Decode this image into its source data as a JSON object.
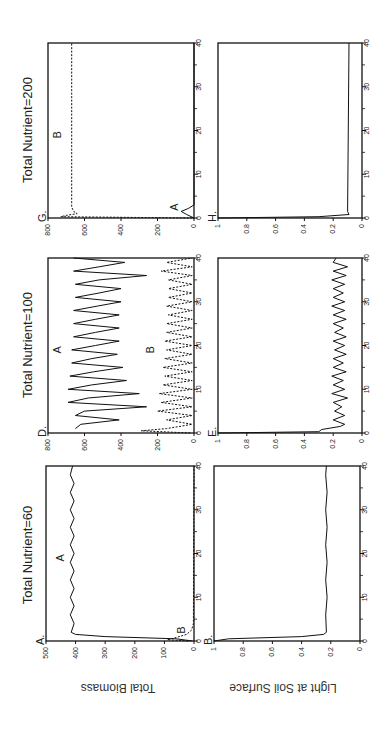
{
  "figure": {
    "orientation": "rotated 90deg counter-clockwise",
    "y_axis_labels": [
      "Total Biomass",
      "Light at Soil Surface"
    ]
  },
  "chart_data": [
    {
      "type": "line",
      "panel": "A",
      "column_title": "Total Nutrient=60",
      "ylabel": "Total Biomass",
      "xlabel": "",
      "x_ticks": [
        0,
        10,
        20,
        30,
        40
      ],
      "y_ticks": [
        0,
        100,
        200,
        300,
        400,
        500
      ],
      "xlim": [
        0,
        40
      ],
      "ylim": [
        0,
        500
      ],
      "series": [
        {
          "name": "A",
          "style": "solid",
          "description": "rises quickly to ~410, small oscillations 400-420 with period ~2",
          "x": [
            0,
            0.5,
            1,
            1.5,
            2,
            4,
            6,
            8,
            10,
            12,
            14,
            16,
            18,
            20,
            22,
            24,
            26,
            28,
            30,
            32,
            34,
            36,
            38,
            40
          ],
          "y": [
            5,
            60,
            300,
            400,
            415,
            405,
            418,
            405,
            418,
            405,
            418,
            405,
            418,
            405,
            418,
            405,
            418,
            405,
            418,
            405,
            418,
            405,
            418,
            410
          ]
        },
        {
          "name": "B",
          "style": "dashed",
          "description": "small transient peak ~90 near t=0.3 then decays to ~0",
          "x": [
            0,
            0.3,
            0.8,
            1.5,
            2.5,
            4,
            40
          ],
          "y": [
            20,
            90,
            60,
            25,
            8,
            2,
            0
          ]
        }
      ]
    },
    {
      "type": "line",
      "panel": "B",
      "column_title": "Total Nutrient=60",
      "ylabel": "Light at Soil Surface",
      "xlabel": "",
      "x_ticks": [
        0,
        10,
        20,
        30,
        40
      ],
      "y_ticks": [
        0,
        0.2,
        0.4,
        0.6,
        0.8,
        1
      ],
      "xlim": [
        0,
        40
      ],
      "ylim": [
        0,
        1
      ],
      "series": [
        {
          "name": "light",
          "style": "solid",
          "description": "drops from 1 to ~0.23 by t=1.5, small oscillations ~0.22-0.24",
          "x": [
            0,
            0.5,
            1,
            1.5,
            2,
            6,
            10,
            14,
            18,
            22,
            26,
            30,
            34,
            38,
            40
          ],
          "y": [
            1,
            0.9,
            0.4,
            0.25,
            0.23,
            0.235,
            0.225,
            0.235,
            0.225,
            0.235,
            0.225,
            0.235,
            0.225,
            0.235,
            0.23
          ]
        }
      ]
    },
    {
      "type": "line",
      "panel": "D",
      "column_title": "Total Nutrient=100",
      "ylabel": "Total Biomass",
      "xlabel": "",
      "x_ticks": [
        0,
        10,
        20,
        30,
        40
      ],
      "y_ticks": [
        0,
        200,
        400,
        600,
        800
      ],
      "xlim": [
        0,
        40
      ],
      "ylim": [
        0,
        800
      ],
      "series": [
        {
          "name": "A",
          "style": "solid",
          "description": "large oscillations between ~250-420 troughs and ~650-700 peaks, period ~3",
          "x": [
            1,
            2,
            3,
            4,
            5,
            6,
            7,
            8,
            9,
            10,
            11,
            12,
            13,
            14,
            15,
            16,
            17,
            18,
            19,
            20,
            21,
            22,
            23,
            24,
            25,
            26,
            27,
            28,
            29,
            30,
            31,
            32,
            33,
            34,
            35,
            36,
            37,
            38,
            39,
            40
          ],
          "y": [
            650,
            620,
            410,
            650,
            600,
            260,
            690,
            580,
            300,
            690,
            560,
            370,
            680,
            550,
            390,
            670,
            560,
            420,
            670,
            540,
            410,
            660,
            540,
            410,
            660,
            540,
            410,
            660,
            530,
            400,
            650,
            520,
            400,
            650,
            520,
            260,
            660,
            520,
            380,
            660
          ]
        },
        {
          "name": "B",
          "style": "dashed",
          "description": "oscillations 0 to ~200 out of phase with A",
          "x": [
            0,
            0.5,
            1,
            2,
            3,
            4,
            5,
            6,
            7,
            8,
            9,
            10,
            11,
            12,
            13,
            14,
            15,
            16,
            17,
            18,
            19,
            20,
            21,
            22,
            23,
            24,
            25,
            26,
            27,
            28,
            29,
            30,
            31,
            32,
            33,
            34,
            35,
            36,
            37,
            38,
            39,
            40
          ],
          "y": [
            20,
            290,
            150,
            10,
            150,
            10,
            200,
            10,
            180,
            10,
            190,
            10,
            170,
            10,
            160,
            10,
            170,
            10,
            160,
            10,
            150,
            10,
            160,
            10,
            150,
            10,
            150,
            10,
            140,
            10,
            150,
            10,
            140,
            10,
            140,
            10,
            140,
            10,
            180,
            10,
            150,
            10
          ]
        }
      ]
    },
    {
      "type": "line",
      "panel": "E",
      "column_title": "Total Nutrient=100",
      "ylabel": "Light at Soil Surface",
      "xlabel": "",
      "x_ticks": [
        0,
        10,
        20,
        30,
        40
      ],
      "y_ticks": [
        0,
        0.2,
        0.4,
        0.6,
        0.8,
        1
      ],
      "xlim": [
        0,
        40
      ],
      "ylim": [
        0,
        1
      ],
      "series": [
        {
          "name": "light",
          "style": "solid",
          "description": "drops from 1 to ~0.25, then oscillates 0.1-0.22",
          "x": [
            0,
            0.3,
            0.8,
            1.5,
            2,
            3,
            4,
            5,
            6,
            7,
            8,
            9,
            10,
            11,
            12,
            13,
            14,
            15,
            16,
            17,
            18,
            19,
            20,
            21,
            22,
            23,
            24,
            25,
            26,
            27,
            28,
            29,
            30,
            31,
            32,
            33,
            34,
            35,
            36,
            37,
            38,
            39,
            40
          ],
          "y": [
            1,
            0.3,
            0.28,
            0.15,
            0.12,
            0.2,
            0.12,
            0.19,
            0.14,
            0.2,
            0.1,
            0.21,
            0.12,
            0.2,
            0.13,
            0.21,
            0.11,
            0.2,
            0.13,
            0.2,
            0.11,
            0.19,
            0.12,
            0.2,
            0.11,
            0.19,
            0.13,
            0.2,
            0.11,
            0.2,
            0.12,
            0.21,
            0.12,
            0.2,
            0.13,
            0.2,
            0.12,
            0.21,
            0.11,
            0.2,
            0.1,
            0.2,
            0.18
          ]
        }
      ]
    },
    {
      "type": "line",
      "panel": "G",
      "column_title": "Total Nutrient=200",
      "ylabel": "Total Biomass",
      "xlabel": "",
      "x_ticks": [
        0,
        10,
        20,
        30,
        40
      ],
      "y_ticks": [
        0,
        200,
        400,
        600,
        800
      ],
      "xlim": [
        0,
        40
      ],
      "ylim": [
        0,
        800
      ],
      "series": [
        {
          "name": "A",
          "style": "solid",
          "description": "small transient peak ~70 near t=1.5 then 0",
          "x": [
            0,
            0.8,
            1.5,
            2.2,
            3,
            40
          ],
          "y": [
            0,
            40,
            70,
            30,
            0,
            0
          ]
        },
        {
          "name": "B",
          "style": "dashed",
          "description": "rises to ~730 at t=0.5, settles at ~670",
          "x": [
            0,
            0.3,
            0.6,
            1,
            1.5,
            2.5,
            40
          ],
          "y": [
            10,
            730,
            700,
            640,
            660,
            670,
            670
          ]
        }
      ]
    },
    {
      "type": "line",
      "panel": "H",
      "column_title": "Total Nutrient=200",
      "ylabel": "Light at Soil Surface",
      "xlabel": "",
      "x_ticks": [
        0,
        10,
        20,
        30,
        40
      ],
      "y_ticks": [
        0,
        0.2,
        0.4,
        0.6,
        0.8,
        1
      ],
      "xlim": [
        0,
        40
      ],
      "ylim": [
        0,
        1
      ],
      "series": [
        {
          "name": "light",
          "style": "solid",
          "description": "drops from 1 to ~0.09 immediately, flat",
          "x": [
            0,
            0.3,
            0.8,
            1.5,
            40
          ],
          "y": [
            1,
            0.3,
            0.09,
            0.1,
            0.09
          ]
        }
      ]
    }
  ],
  "layout": {
    "columns": [
      {
        "title": "Total Nutrient=60",
        "top_panel": "A",
        "bottom_panel": "B"
      },
      {
        "title": "Total Nutrient=100",
        "top_panel": "D",
        "bottom_panel": "E"
      },
      {
        "title": "Total Nutrient=200",
        "top_panel": "G",
        "bottom_panel": "H"
      }
    ],
    "curve_labels": {
      "A": [
        {
          "text": "A",
          "x": 19,
          "y": 440
        },
        {
          "text": "B",
          "x": 2.5,
          "y": 30
        }
      ],
      "D": [
        {
          "text": "A",
          "x": 19,
          "y": 730
        },
        {
          "text": "B",
          "x": 19,
          "y": 220
        }
      ],
      "G": [
        {
          "text": "B",
          "x": 19,
          "y": 730
        },
        {
          "text": "A",
          "x": 2.5,
          "y": 90
        }
      ]
    }
  }
}
